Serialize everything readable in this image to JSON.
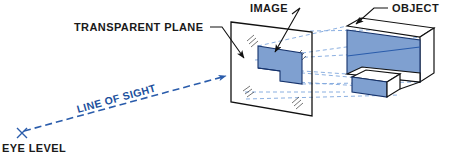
{
  "figure": {
    "background_color": "#ffffff"
  },
  "labels": {
    "transparent_plane": "TRANSPARENT PLANE",
    "image": "IMAGE",
    "object": "OBJECT",
    "line_of_sight": "LINE OF SIGHT",
    "eye_level": "EYE LEVEL"
  },
  "colors": {
    "solid_line": "#111111",
    "object_fill": "#7fa0d0",
    "object_edge": "#15326b",
    "projection_line": "#7ea6dd",
    "sight_line": "#2a5cab",
    "white_face": "#ffffff",
    "text": "#1a1a1a"
  },
  "geometry": {
    "transparent_plane": {
      "shape": "parallelogram",
      "points": "231,22 312,32 312,116 231,102"
    },
    "image_outline": {
      "shape": "L-shaped blue panel projected on plane",
      "points": "258,46 302,53 302,84 280,81 280,71 258,68"
    },
    "object": {
      "shape": "rectangular block with bottom front notch",
      "front_face_points": "347,26 420,37 420,82 347,74",
      "top_face_points": "347,26 362,18 434,29 420,37",
      "right_face_points": "420,37 434,29 434,74 420,82"
    },
    "sight_line": {
      "from": "22,133",
      "to": "228,75",
      "arrow": "right-pointing at plane"
    },
    "eye_marker": {
      "type": "x-cross",
      "at": "22,133"
    }
  },
  "annotations": {
    "transparent_plane_leader": "horizontal then diagonal arrow into plane face",
    "image_leader": "horizontal then diagonal arrow down-left to blue image",
    "object_leader": "horizontal then diagonal arrow down-left to object top"
  }
}
